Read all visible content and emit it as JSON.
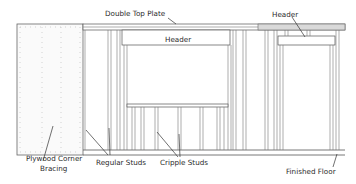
{
  "diagram": {
    "labels": {
      "double_top_plate": "Double Top Plate",
      "header_window": "Header",
      "header_door": "Header",
      "plywood_line1": "Plywood Corner",
      "plywood_line2": "Bracing",
      "regular_studs": "Regular Studs",
      "cripple_studs": "Cripple Studs",
      "finished_floor": "Finished Floor"
    },
    "colors": {
      "line": "#555555",
      "text": "#2a2a2a",
      "plate_fill": "#d9d9d9",
      "background": "#ffffff"
    }
  }
}
